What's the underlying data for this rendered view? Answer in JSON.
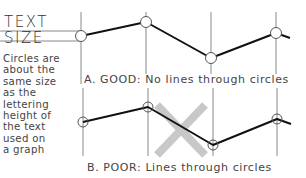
{
  "diagram": {
    "title_lines": [
      "TEXT",
      "SIZE"
    ],
    "note_lines": [
      "Circles are",
      "about the",
      "same size",
      "as the",
      "lettering",
      "height of",
      "the text",
      "used on",
      "a graph"
    ],
    "examples": [
      {
        "id": "good",
        "caption": "A. GOOD: No lines through circles",
        "points": [
          [
            81,
            36
          ],
          [
            146,
            22
          ],
          [
            211,
            58
          ],
          [
            276,
            33
          ]
        ],
        "line_end": [
          290,
          38
        ],
        "verticals_x": [
          81,
          146,
          211,
          276
        ],
        "vertical_range": [
          12,
          84
        ],
        "circle_style": "hollow-white-fill"
      },
      {
        "id": "poor",
        "caption": "B. POOR: Lines through circles",
        "points": [
          [
            83,
            122
          ],
          [
            148,
            107
          ],
          [
            213,
            145
          ],
          [
            277,
            119
          ]
        ],
        "line_end": [
          291,
          124
        ],
        "verticals_x": [
          83,
          148,
          213,
          277
        ],
        "vertical_range": [
          88,
          156
        ],
        "circle_style": "transparent-line-passes-through",
        "cross_mark": {
          "x1": 157,
          "y1": 105,
          "x2": 205,
          "y2": 155
        }
      }
    ],
    "colors": {
      "text": "#444444",
      "gridline": "#888888",
      "data_line": "#111111",
      "cross": "#c8c8c8"
    }
  }
}
